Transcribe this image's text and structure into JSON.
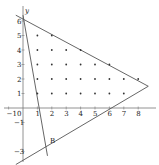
{
  "figure": {
    "axis_labels": {
      "y": "y"
    },
    "x_ticks": [
      {
        "v": -1,
        "label": "−1"
      },
      {
        "v": 0,
        "label": "0"
      },
      {
        "v": 1,
        "label": "1"
      },
      {
        "v": 2,
        "label": "2"
      },
      {
        "v": 3,
        "label": "3"
      },
      {
        "v": 4,
        "label": "4"
      },
      {
        "v": 5,
        "label": "5"
      },
      {
        "v": 6,
        "label": "6"
      },
      {
        "v": 7,
        "label": "7"
      },
      {
        "v": 8,
        "label": "8"
      }
    ],
    "y_ticks": [
      {
        "v": 6,
        "label": "6"
      },
      {
        "v": 5,
        "label": "5"
      },
      {
        "v": 4,
        "label": "4"
      },
      {
        "v": 3,
        "label": "3"
      },
      {
        "v": 2,
        "label": "2"
      },
      {
        "v": 1,
        "label": "1"
      },
      {
        "v": -1,
        "label": "−1"
      },
      {
        "v": -3,
        "label": "−3"
      }
    ],
    "point_label": "B",
    "lines": [
      {
        "name": "steep-line",
        "from": [
          0,
          6.4
        ],
        "to": [
          1.7,
          -3.3
        ]
      },
      {
        "name": "upper-line",
        "from": [
          -0.5,
          6.4
        ],
        "to": [
          8.7,
          1.5
        ]
      },
      {
        "name": "lower-line",
        "from": [
          -0.5,
          -3.9
        ],
        "to": [
          8.7,
          1.5
        ]
      }
    ],
    "lattice_points": [
      [
        1,
        5
      ],
      [
        2,
        5
      ],
      [
        1,
        4
      ],
      [
        2,
        4
      ],
      [
        3,
        4
      ],
      [
        4,
        4
      ],
      [
        1,
        3
      ],
      [
        2,
        3
      ],
      [
        3,
        3
      ],
      [
        4,
        3
      ],
      [
        5,
        3
      ],
      [
        6,
        3
      ],
      [
        1,
        2
      ],
      [
        2,
        2
      ],
      [
        3,
        2
      ],
      [
        4,
        2
      ],
      [
        5,
        2
      ],
      [
        6,
        2
      ],
      [
        7,
        2
      ],
      [
        8,
        2
      ],
      [
        1,
        1
      ],
      [
        2,
        1
      ],
      [
        3,
        1
      ],
      [
        4,
        1
      ],
      [
        5,
        1
      ],
      [
        6,
        1
      ],
      [
        7,
        1
      ]
    ],
    "colors": {
      "line": "#555555",
      "axis": "#777777",
      "dot": "#333333"
    }
  }
}
